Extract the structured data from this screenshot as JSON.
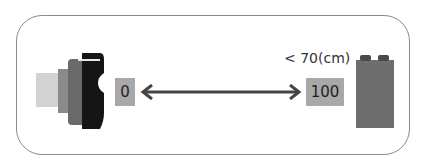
{
  "diagram": {
    "min_value_label": "0",
    "max_value_label": "100",
    "distance_label": "< 70(cm)",
    "colors": {
      "frame": "#8a8a8a",
      "value_box": "#a8a8a8",
      "arrow": "#444444",
      "brick": "#6e6e6e",
      "sensor_dark": "#1a1a1a",
      "sensor_body": "#7a7a7a",
      "sensor_light": "#d0d0d0"
    }
  }
}
